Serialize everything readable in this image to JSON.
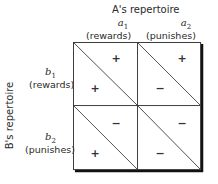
{
  "diagram": {
    "column_title": "A's repertoire",
    "row_title": "B's repertoire",
    "columns": [
      {
        "symbol": "a",
        "subscript": "1",
        "label": "(rewards)"
      },
      {
        "symbol": "a",
        "subscript": "2",
        "label": "(punishes)"
      }
    ],
    "rows": [
      {
        "symbol": "b",
        "subscript": "1",
        "label": "(rewards)"
      },
      {
        "symbol": "b",
        "subscript": "2",
        "label": "(punishes)"
      }
    ],
    "cells": [
      [
        {
          "upper_right": "+",
          "lower_left": "+"
        },
        {
          "upper_right": "+",
          "lower_left": "−"
        }
      ],
      [
        {
          "upper_right": "−",
          "lower_left": "+"
        },
        {
          "upper_right": "−",
          "lower_left": "−"
        }
      ]
    ],
    "colors": {
      "line": "#3a3a3a",
      "shadow": "#111111",
      "text": "#2a2a2a"
    }
  }
}
